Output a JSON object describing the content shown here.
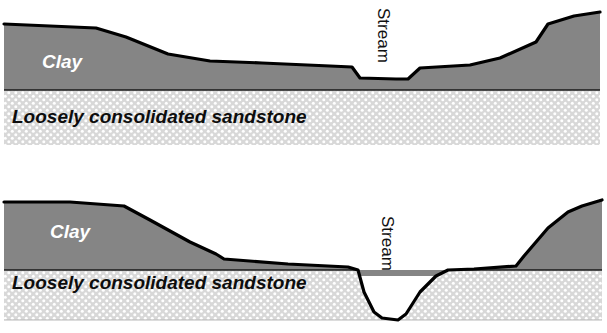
{
  "figure": {
    "background_color": "#ffffff",
    "width": 607,
    "height": 333
  },
  "colors": {
    "clay_fill": "#858585",
    "sandstone_fill": "#d8d8d8",
    "sandstone_dot": "#ffffff",
    "surface_line": "#000000",
    "contact_line": "#1a1a1a",
    "clay_label_text": "#ffffff",
    "sandstone_label_text": "#0d0d0d",
    "stream_label_text": "#111111"
  },
  "panels": [
    {
      "id": "panel-top",
      "name": "shallow-incision-cross-section",
      "layers": [
        {
          "id": "clay",
          "label": "Clay",
          "fill": "#858585",
          "texture": "solid-gray",
          "label_x": 42,
          "label_y": 68
        },
        {
          "id": "sandstone",
          "label": "Loosely consolidated sandstone",
          "fill": "#d8d8d8",
          "texture": "stippled-dots",
          "label_x": 12,
          "label_y": 123
        }
      ],
      "stream": {
        "label": "Stream",
        "rotation_deg": 90,
        "label_x": 378,
        "label_y": 8,
        "incision_depth": "shallow",
        "cuts_into": "clay"
      },
      "surface_path": "M 4,24 L 96,28 L 126,37 L 168,54 L 210,61 L 262,63 L 330,66 L 352,67 L 360,78 L 396,79 L 408,79 L 420,68 L 470,65 L 500,58 L 536,42 L 548,24 L 574,16 L 600,12",
      "contact_y": 90,
      "base_y": 145,
      "left_x": 4,
      "right_x": 600
    },
    {
      "id": "panel-bottom",
      "name": "deep-incision-cross-section",
      "layers": [
        {
          "id": "clay",
          "label": "Clay",
          "fill": "#858585",
          "texture": "solid-gray",
          "label_x": 50,
          "label_y": 72
        },
        {
          "id": "sandstone",
          "label": "Loosely consolidated sandstone",
          "fill": "#d8d8d8",
          "texture": "stippled-dots",
          "label_x": 12,
          "label_y": 123
        }
      ],
      "stream": {
        "label": "Stream",
        "rotation_deg": 90,
        "label_x": 382,
        "label_y": 50,
        "incision_depth": "deep",
        "cuts_into": "sandstone"
      },
      "surface_path": "M 4,36 L 70,36 L 124,40 L 150,54 L 190,76 L 216,88 L 224,93 L 288,98 L 348,101 L 358,104 L 364,126 L 374,146 L 382,152 L 398,154 L 406,148 L 420,126 L 436,110 L 448,104 L 474,103 L 516,100 L 524,90 L 548,62 L 568,46 L 582,40 L 602,34",
      "contact_y": 104,
      "base_y": 154,
      "left_x": 4,
      "right_x": 602
    }
  ],
  "annotations": {
    "caption_top": "Clay",
    "caption_bottom": "Loosely consolidated sandstone",
    "stream_label": "Stream"
  }
}
